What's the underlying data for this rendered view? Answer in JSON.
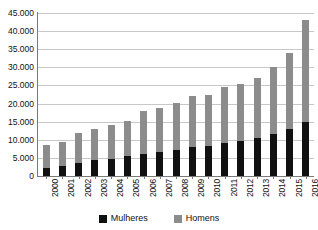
{
  "chart_data": {
    "type": "bar",
    "stacked": true,
    "title": "",
    "xlabel": "",
    "ylabel": "",
    "grid": true,
    "legend_position": "bottom",
    "ylim": [
      0,
      45000
    ],
    "ytick_values": [
      0,
      5000,
      10000,
      15000,
      20000,
      25000,
      30000,
      35000,
      40000,
      45000
    ],
    "ytick_labels": [
      "0",
      "5.000",
      "10.000",
      "15.000",
      "20.000",
      "25.000",
      "30.000",
      "35.000",
      "40.000",
      "45.000"
    ],
    "categories": [
      "2000",
      "2001",
      "2002",
      "2003",
      "2004",
      "2005",
      "2006",
      "2007",
      "2008",
      "2009",
      "2010",
      "2011",
      "2012",
      "2013",
      "2014",
      "2015",
      "2016"
    ],
    "series": [
      {
        "name": "Mulheres",
        "color": "#111111",
        "values": [
          2200,
          2700,
          3700,
          4300,
          4700,
          5400,
          6100,
          6500,
          7200,
          8000,
          8300,
          9200,
          9800,
          10400,
          11600,
          13000,
          15000
        ]
      },
      {
        "name": "Homens",
        "color": "#8c8c8c",
        "values": [
          6300,
          6800,
          8300,
          8700,
          9300,
          9800,
          11800,
          12200,
          13000,
          14000,
          14200,
          15300,
          15700,
          16600,
          18400,
          21000,
          28000
        ]
      }
    ],
    "totals": [
      8500,
      9500,
      12000,
      13000,
      14000,
      15200,
      17900,
      18700,
      20200,
      22000,
      22500,
      24500,
      25500,
      27000,
      30000,
      34000,
      43000
    ]
  },
  "legend": {
    "entries": [
      {
        "label": "Mulheres",
        "color": "#111111"
      },
      {
        "label": "Homens",
        "color": "#8c8c8c"
      }
    ]
  }
}
